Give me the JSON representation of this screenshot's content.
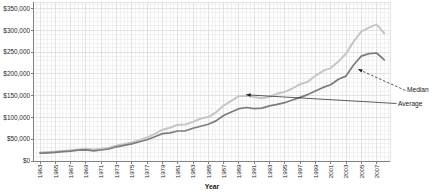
{
  "chart_data": {
    "type": "line",
    "title": "",
    "xlabel": "Year",
    "ylabel": "",
    "legend_position": "right-callouts",
    "grid": "fine-minor-grid-on",
    "x_range": [
      1962.15,
      2008.75
    ],
    "y_range": [
      0,
      365000
    ],
    "x_ticks": [
      "1963",
      "1965",
      "1967",
      "1969",
      "1971",
      "1973",
      "1975",
      "1977",
      "1979",
      "1981",
      "1983",
      "1985",
      "1987",
      "1989",
      "1991",
      "1993",
      "1995",
      "1997",
      "1999",
      "2001",
      "2003",
      "2005",
      "2007"
    ],
    "y_ticks": [
      "$0",
      "$50,000",
      "$100,000",
      "$150,000",
      "$200,000",
      "$250,000",
      "$300,000",
      "$350,000"
    ],
    "y_tick_step": 50000,
    "minor_grid_y_step": 10000,
    "minor_grid_x_step_years": 0.5,
    "years": [
      1963,
      1964,
      1965,
      1966,
      1967,
      1968,
      1969,
      1970,
      1971,
      1972,
      1973,
      1974,
      1975,
      1976,
      1977,
      1978,
      1979,
      1980,
      1981,
      1982,
      1983,
      1984,
      1985,
      1986,
      1987,
      1988,
      1989,
      1990,
      1991,
      1992,
      1993,
      1994,
      1995,
      1996,
      1997,
      1998,
      1999,
      2000,
      2001,
      2002,
      2003,
      2004,
      2005,
      2006,
      2007,
      2008
    ],
    "series": [
      {
        "name": "Average",
        "color": "#c5c7c1",
        "values": [
          19300,
          20500,
          21500,
          23300,
          24600,
          26600,
          27900,
          26600,
          28300,
          30500,
          35500,
          38900,
          42600,
          48000,
          54200,
          62500,
          71800,
          76400,
          83000,
          83900,
          89800,
          97600,
          100800,
          111900,
          127200,
          138300,
          148800,
          149800,
          147200,
          144100,
          147700,
          154500,
          158700,
          166400,
          176200,
          181900,
          195600,
          207000,
          213200,
          228700,
          246300,
          274500,
          297000,
          305900,
          313600,
          292600
        ]
      },
      {
        "name": "Median",
        "color": "#7c7c7c",
        "values": [
          18000,
          18900,
          20000,
          21400,
          22700,
          24700,
          25600,
          23400,
          25200,
          27600,
          32500,
          35900,
          39300,
          44200,
          48800,
          55700,
          62900,
          64600,
          68900,
          69300,
          75300,
          79900,
          84300,
          92000,
          104500,
          112500,
          120000,
          122900,
          120000,
          121500,
          126500,
          130000,
          133900,
          140000,
          146000,
          152500,
          161000,
          169000,
          175200,
          187600,
          195000,
          221000,
          240900,
          246500,
          247900,
          232100
        ]
      }
    ],
    "annotations": [
      {
        "label": "Median",
        "series": "Median",
        "target": {
          "year": 2004.55,
          "value": 211000
        },
        "leader_style": "dashed",
        "label_px": [
          405.5,
          90.5
        ]
      },
      {
        "label": "Average",
        "series": "Average",
        "target": {
          "year": 1989.95,
          "value": 152000
        },
        "leader_style": "solid",
        "label_px": [
          396.5,
          103.5
        ]
      }
    ],
    "colors": {
      "minor_grid": "#e9e9e9",
      "major_grid": "#dcdcdc",
      "plot_border": "#d9d9d9",
      "axis": "#808080",
      "annotation": "#1a1a1a",
      "background": "#ffffff"
    }
  }
}
